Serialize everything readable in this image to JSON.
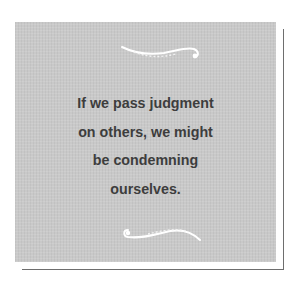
{
  "quote": {
    "lines": [
      "If we pass judgment",
      "on others, we might",
      "be condemning",
      "ourselves."
    ]
  },
  "ornaments": {
    "top": "flourish-icon",
    "bottom": "flourish-icon"
  },
  "colors": {
    "card_background": "#c9c9c9",
    "text": "#3d3d3d",
    "shadow_line": "#6e6e6e",
    "ornament": "#ffffff"
  }
}
